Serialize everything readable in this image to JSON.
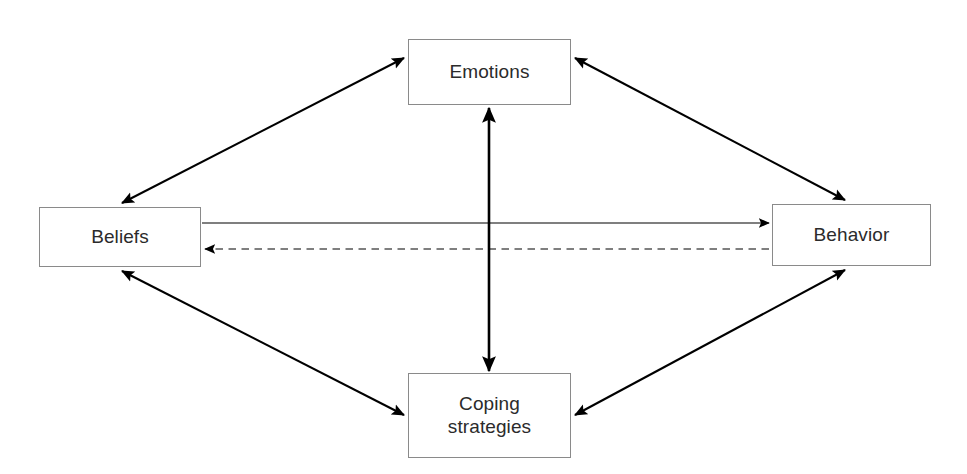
{
  "diagram": {
    "background_color": "#ffffff",
    "box_border_color": "#8a8a8a",
    "line_color": "#000000",
    "text_color": "#2b2b2b",
    "nodes": [
      {
        "id": "emotions",
        "label": "Emotions",
        "position": "top"
      },
      {
        "id": "beliefs",
        "label": "Beliefs",
        "position": "left"
      },
      {
        "id": "behavior",
        "label": "Behavior",
        "position": "right"
      },
      {
        "id": "coping",
        "label": "Coping\nstrategies",
        "position": "bottom"
      }
    ],
    "edges": [
      {
        "id": "beliefs-emotions",
        "from": "Beliefs",
        "to": "Emotions",
        "style": "solid",
        "arrows": "both"
      },
      {
        "id": "emotions-behavior",
        "from": "Emotions",
        "to": "Behavior",
        "style": "solid",
        "arrows": "both"
      },
      {
        "id": "beliefs-coping",
        "from": "Beliefs",
        "to": "Coping strategies",
        "style": "solid",
        "arrows": "both"
      },
      {
        "id": "coping-behavior",
        "from": "Coping strategies",
        "to": "Behavior",
        "style": "solid",
        "arrows": "both"
      },
      {
        "id": "emotions-coping",
        "from": "Emotions",
        "to": "Coping strategies",
        "style": "solid",
        "arrows": "both"
      },
      {
        "id": "beliefs-behavior",
        "from": "Beliefs",
        "to": "Behavior",
        "style": "solid",
        "arrows": "forward"
      },
      {
        "id": "behavior-beliefs",
        "from": "Behavior",
        "to": "Beliefs",
        "style": "dashed",
        "arrows": "forward"
      }
    ]
  }
}
